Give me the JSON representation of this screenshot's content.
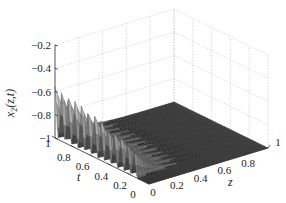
{
  "chart_data": {
    "type": "surface3d",
    "title": "",
    "zlabel": "x2(z,t)",
    "zlabel_main": "x",
    "zlabel_sub": "2",
    "zlabel_args": "(z,t)",
    "xlabel": "z",
    "ylabel": "t",
    "z_axis_range": [
      -1,
      -0.2
    ],
    "z_ticks": [
      "-0.2",
      "-0.4",
      "-0.6",
      "-0.8",
      "-1"
    ],
    "z_tick_values": [
      -0.2,
      -0.4,
      -0.6,
      -0.8,
      -1
    ],
    "x_axis_range": [
      0,
      1
    ],
    "x_ticks": [
      "0",
      "0.2",
      "0.4",
      "0.6",
      "0.8",
      "1"
    ],
    "x_tick_values": [
      0,
      0.2,
      0.4,
      0.6,
      0.8,
      1
    ],
    "y_axis_range": [
      0,
      1
    ],
    "y_ticks": [
      "0",
      "0.2",
      "0.4",
      "0.6",
      "0.8",
      "1"
    ],
    "y_tick_values": [
      0,
      0.2,
      0.4,
      0.6,
      0.8,
      1
    ],
    "grid": true,
    "surface": {
      "description": "Surface near -1 everywhere except a series of sharp oscillating ridges along z≈0 across t; peak heights decrease from about -0.55 at t=1 to about -0.8 near t=0.15",
      "baseline": -1.0,
      "ridge_count": 13,
      "ridge_t_values": [
        1.0,
        0.93,
        0.86,
        0.79,
        0.72,
        0.65,
        0.58,
        0.51,
        0.44,
        0.37,
        0.3,
        0.23,
        0.16
      ],
      "ridge_peak_values": [
        -0.56,
        -0.57,
        -0.58,
        -0.6,
        -0.61,
        -0.62,
        -0.64,
        -0.66,
        -0.68,
        -0.7,
        -0.72,
        -0.75,
        -0.78
      ],
      "ridge_decay_z": 0.12
    },
    "colormap": "gray"
  }
}
